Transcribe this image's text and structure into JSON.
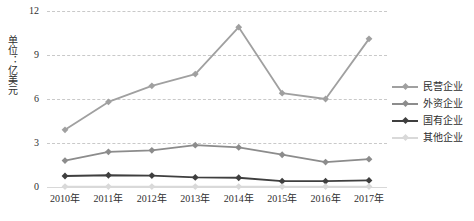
{
  "chart_data": {
    "type": "line",
    "title": "",
    "xlabel": "",
    "ylabel": "单位：亿美元",
    "categories": [
      "2010年",
      "2011年",
      "2012年",
      "2013年",
      "2014年",
      "2015年",
      "2016年",
      "2017年"
    ],
    "ylim": [
      0,
      12
    ],
    "yticks": [
      0,
      3,
      6,
      9,
      12
    ],
    "ytick_labels": [
      "0",
      "3",
      "6",
      "9",
      "12"
    ],
    "grid": true,
    "legend_position": "right",
    "series": [
      {
        "name": "民营企业",
        "color": "#a0a0a0",
        "marker": "diamond",
        "values": [
          3.9,
          5.8,
          6.9,
          7.7,
          10.9,
          6.4,
          6.0,
          10.1
        ]
      },
      {
        "name": "外资企业",
        "color": "#8c8c8c",
        "marker": "diamond",
        "values": [
          1.8,
          2.4,
          2.5,
          2.85,
          2.7,
          2.2,
          1.7,
          1.9
        ]
      },
      {
        "name": "国有企业",
        "color": "#3f3f3f",
        "marker": "diamond",
        "values": [
          0.75,
          0.8,
          0.78,
          0.65,
          0.63,
          0.4,
          0.4,
          0.45
        ]
      },
      {
        "name": "其他企业",
        "color": "#d9d9d9",
        "marker": "diamond",
        "values": [
          0.03,
          0.03,
          0.03,
          0.03,
          0.03,
          0.03,
          0.03,
          0.03
        ]
      }
    ]
  },
  "axis": {
    "unit_label": "单位：亿美元"
  },
  "legend": {
    "items": [
      {
        "label": "民营企业"
      },
      {
        "label": "外资企业"
      },
      {
        "label": "国有企业"
      },
      {
        "label": "其他企业"
      }
    ]
  }
}
